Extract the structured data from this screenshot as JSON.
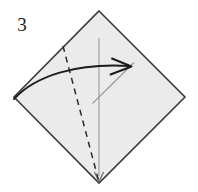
{
  "figure": {
    "type": "origami-fold-diagram",
    "step_label": "3",
    "caption": "",
    "canvas": {
      "width": 198,
      "height": 192
    },
    "colors": {
      "background": "#ffffff",
      "paper_fill": "#ebebeb",
      "paper_outline": "#3c3c3c",
      "crease_dashed": "#2b2b2b",
      "guide_line": "#9a9a9a",
      "fold_arrow": "#1c1c1c",
      "label_text": "#1a1a1a"
    },
    "shapes": {
      "paper": {
        "name": "square-paper-diamond",
        "vertices": [
          {
            "x": 99,
            "y": 11
          },
          {
            "x": 185,
            "y": 97
          },
          {
            "x": 99,
            "y": 183
          },
          {
            "x": 14,
            "y": 97
          }
        ]
      },
      "dashed_crease": {
        "name": "valley-fold-crease",
        "style": "dashed",
        "from": {
          "x": 63,
          "y": 46
        },
        "to": {
          "x": 99,
          "y": 182
        },
        "dash_pattern": "6,5"
      },
      "vertical_guide": {
        "name": "vertical-center-guide",
        "from": {
          "x": 99,
          "y": 38
        },
        "to": {
          "x": 99,
          "y": 178
        },
        "arrow_end": "down"
      },
      "diagonal_guide": {
        "name": "diagonal-reference-guide",
        "from": {
          "x": 93,
          "y": 103
        },
        "to": {
          "x": 134,
          "y": 63
        }
      },
      "fold_arrow": {
        "name": "curved-fold-arrow",
        "start": {
          "x": 14,
          "y": 99
        },
        "control1": {
          "x": 40,
          "y": 74
        },
        "control2": {
          "x": 80,
          "y": 64
        },
        "end": {
          "x": 128,
          "y": 66
        },
        "head_at": {
          "x": 128,
          "y": 66
        },
        "direction": "right"
      }
    },
    "labels": {
      "step": {
        "text": "3",
        "x": 22,
        "y": 31
      }
    }
  }
}
